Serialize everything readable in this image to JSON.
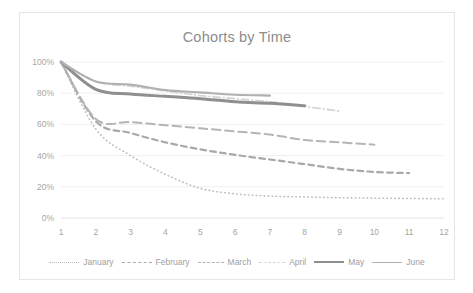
{
  "chart_data": {
    "type": "line",
    "title": "Cohorts by Time",
    "xlabel": "",
    "ylabel": "",
    "xlim": [
      1,
      12
    ],
    "ylim": [
      0,
      1
    ],
    "grid": true,
    "legend_position": "bottom",
    "x": [
      1,
      2,
      3,
      4,
      5,
      6,
      7,
      8,
      9,
      10,
      11,
      12
    ],
    "x_tick_labels": [
      "1",
      "2",
      "3",
      "4",
      "5",
      "6",
      "7",
      "8",
      "9",
      "10",
      "11",
      "12"
    ],
    "y_tick_labels": [
      "0%",
      "20%",
      "40%",
      "60%",
      "80%",
      "100%"
    ],
    "y_tick_values": [
      0,
      0.2,
      0.4,
      0.6,
      0.8,
      1.0
    ],
    "series": [
      {
        "name": "January",
        "style": "dotted",
        "color": "#bfbfbf",
        "width": 1.6,
        "x": [
          1,
          2,
          3,
          4,
          5,
          6,
          7,
          8,
          9,
          10,
          11,
          12
        ],
        "values": [
          1.0,
          0.57,
          0.4,
          0.28,
          0.19,
          0.155,
          0.14,
          0.135,
          0.13,
          0.127,
          0.125,
          0.123
        ]
      },
      {
        "name": "February",
        "style": "dashed",
        "color": "#a9a9a9",
        "width": 2.2,
        "x": [
          1,
          2,
          3,
          4,
          5,
          6,
          7,
          8,
          9,
          10,
          11
        ],
        "values": [
          1.0,
          0.62,
          0.545,
          0.485,
          0.44,
          0.405,
          0.375,
          0.345,
          0.315,
          0.295,
          0.288
        ]
      },
      {
        "name": "March",
        "style": "longdash",
        "color": "#b5b5b5",
        "width": 2.0,
        "x": [
          1,
          2,
          3,
          4,
          5,
          6,
          7,
          8,
          9,
          10
        ],
        "values": [
          1.0,
          0.635,
          0.615,
          0.595,
          0.575,
          0.555,
          0.535,
          0.5,
          0.485,
          0.47
        ]
      },
      {
        "name": "April",
        "style": "dashdot",
        "color": "#d6d6d6",
        "width": 1.8,
        "x": [
          1,
          2,
          3,
          4,
          5,
          6,
          7,
          8,
          9
        ],
        "values": [
          1.0,
          0.875,
          0.845,
          0.815,
          0.785,
          0.765,
          0.745,
          0.715,
          0.685
        ]
      },
      {
        "name": "May",
        "style": "solid",
        "color": "#8f8f8f",
        "width": 3.0,
        "x": [
          1,
          2,
          3,
          4,
          5,
          6,
          7,
          8
        ],
        "values": [
          1.0,
          0.825,
          0.795,
          0.78,
          0.765,
          0.745,
          0.735,
          0.72
        ]
      },
      {
        "name": "June",
        "style": "solid",
        "color": "#b0b0b0",
        "width": 2.2,
        "x": [
          1,
          2,
          3,
          4,
          5,
          6,
          7
        ],
        "values": [
          1.0,
          0.875,
          0.855,
          0.82,
          0.805,
          0.79,
          0.785
        ]
      }
    ]
  }
}
